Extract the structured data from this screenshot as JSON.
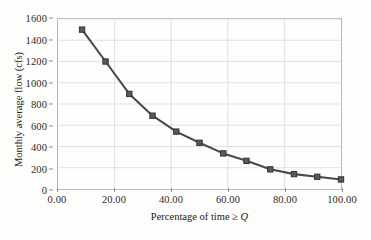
{
  "chart_data": {
    "type": "line",
    "title": "",
    "xlabel": "Percentage of time ≥ Q",
    "xlabel_prefix": "Percentage of time ≥ ",
    "xlabel_variable": "Q",
    "ylabel": "Monthly average flow (cfs)",
    "xlim": [
      0.0,
      100.0
    ],
    "ylim": [
      0,
      1600
    ],
    "xticks": [
      0.0,
      20.0,
      40.0,
      60.0,
      80.0,
      100.0
    ],
    "xtick_labels": [
      "0.00",
      "20.00",
      "40.00",
      "60.00",
      "80.00",
      "100.00"
    ],
    "yticks": [
      0,
      200,
      400,
      600,
      800,
      1000,
      1200,
      1400,
      1600
    ],
    "ytick_labels": [
      "0",
      "200",
      "400",
      "600",
      "800",
      "1000",
      "1200",
      "1400",
      "1600"
    ],
    "grid": true,
    "legend": false,
    "marker": "square",
    "line_color": "#4a4a4d",
    "marker_color": "#5a5a5d",
    "grid_color": "#d3d3d8",
    "frame_color": "#b9b9bd",
    "background_color": "#fdfdfc",
    "x": [
      8.5,
      16.8,
      25.2,
      33.4,
      41.8,
      50.0,
      58.4,
      66.6,
      75.0,
      83.4,
      91.6,
      100.0
    ],
    "y": [
      1500,
      1200,
      895,
      690,
      540,
      435,
      335,
      265,
      185,
      140,
      115,
      90
    ],
    "series": [
      {
        "name": "Flow duration curve",
        "points": [
          {
            "x": 8.5,
            "y": 1500
          },
          {
            "x": 16.8,
            "y": 1200
          },
          {
            "x": 25.2,
            "y": 895
          },
          {
            "x": 33.4,
            "y": 690
          },
          {
            "x": 41.8,
            "y": 540
          },
          {
            "x": 50.0,
            "y": 435
          },
          {
            "x": 58.4,
            "y": 335
          },
          {
            "x": 66.6,
            "y": 265
          },
          {
            "x": 75.0,
            "y": 185
          },
          {
            "x": 83.4,
            "y": 140
          },
          {
            "x": 91.6,
            "y": 115
          },
          {
            "x": 100.0,
            "y": 90
          }
        ]
      }
    ]
  }
}
